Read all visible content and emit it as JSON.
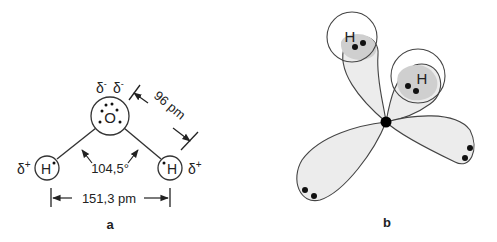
{
  "panel_a": {
    "label": "a",
    "oxygen": {
      "symbol": "O",
      "charges": [
        "δ-",
        "δ-"
      ]
    },
    "hydrogen_left": {
      "symbol": "H",
      "charge": "δ+"
    },
    "hydrogen_right": {
      "symbol": "H",
      "charge": "δ+"
    },
    "bond_length": "96 pm",
    "bond_angle": "104,5°",
    "h_h_distance": "151,3 pm"
  },
  "panel_b": {
    "label": "b",
    "hydrogen_top": {
      "symbol": "H"
    },
    "hydrogen_right": {
      "symbol": "H"
    }
  },
  "colors": {
    "line": "#333333",
    "lobe_fill": "#ececec",
    "h_overlap_fill": "#cfcfcf"
  }
}
